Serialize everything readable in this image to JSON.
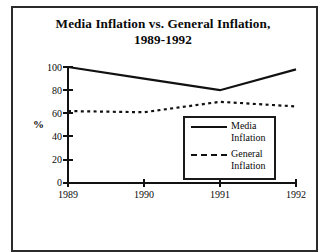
{
  "chart_data": {
    "type": "line",
    "title": "Media Inflation vs. General Inflation, 1989-1992",
    "title_line1": "Media Inflation vs. General Inflation,",
    "title_line2": "1989-1992",
    "xlabel": "",
    "ylabel": "%",
    "x": [
      "1989",
      "1990",
      "1991",
      "1992"
    ],
    "categories": [
      "1989",
      "1990",
      "1991",
      "1992"
    ],
    "xtick_labels": [
      "1989",
      "1990",
      "1991",
      "1992"
    ],
    "ytick_labels": [
      "0",
      "20",
      "40",
      "60",
      "80",
      "100"
    ],
    "yticks": [
      0,
      20,
      40,
      60,
      80,
      100
    ],
    "ylim": [
      0,
      100
    ],
    "grid": false,
    "legend_position": "center-right-inside",
    "series": [
      {
        "name": "Media Inflation",
        "name_line1": "Media",
        "name_line2": "Inflation",
        "style": "solid",
        "color": "#111111",
        "values": [
          100,
          90,
          80,
          98
        ]
      },
      {
        "name": "General Inflation",
        "name_line1": "General",
        "name_line2": "Inflation",
        "style": "dashed",
        "color": "#111111",
        "values": [
          62,
          61,
          70,
          66
        ]
      }
    ]
  },
  "figure": {
    "border_color": "#2b2b2b",
    "background": "#ffffff"
  }
}
